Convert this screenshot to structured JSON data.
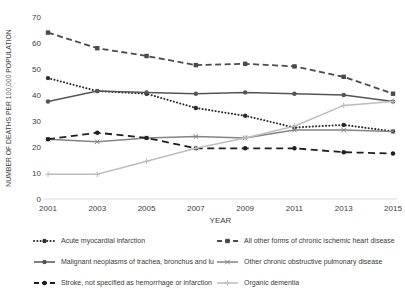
{
  "chart_data": {
    "type": "line",
    "title": "",
    "x": [
      2001,
      2003,
      2005,
      2007,
      2009,
      2011,
      2013,
      2015
    ],
    "xlabel": "YEAR",
    "ylabel": "NUMBER OF DEATHS PER 100,000 POPULATION",
    "y_ticks": [
      0,
      10,
      20,
      30,
      40,
      50,
      60,
      70
    ],
    "ylim": [
      0,
      70
    ],
    "grid": false,
    "legend_position": "bottom",
    "axis_color": "#d9d9d9",
    "text_color": "#3d3d3d",
    "series": [
      {
        "name": "Acute myocardial infarction",
        "values": [
          46.5,
          41.5,
          40.5,
          35,
          32,
          27.5,
          28.5,
          26
        ],
        "color": "#2b2b2b",
        "line": "dotted",
        "marker": "circle"
      },
      {
        "name": "All other forms of chronic ischemic heart disease",
        "values": [
          64,
          58,
          55,
          51.5,
          52,
          51,
          47,
          40.5
        ],
        "color": "#4a4a4a",
        "line": "dashed",
        "marker": "square"
      },
      {
        "name": "Malignant neoplasms of trachea, bronchus and lung",
        "values": [
          37.5,
          41.5,
          41,
          40.5,
          41,
          40.5,
          40,
          37.5
        ],
        "color": "#555555",
        "line": "solid",
        "marker": "circle"
      },
      {
        "name": "Other chronic obstructive pulmonary disease",
        "values": [
          23,
          22,
          23.5,
          24,
          23.5,
          26.5,
          26.5,
          26
        ],
        "color": "#848484",
        "line": "solid",
        "marker": "x"
      },
      {
        "name": "Stroke, not specified as hemorrhage or infarction",
        "values": [
          23,
          25.5,
          23.5,
          19.5,
          19.5,
          19.5,
          18,
          17.5
        ],
        "color": "#1f1f1f",
        "line": "longdash",
        "marker": "circle"
      },
      {
        "name": "Organic dementia",
        "values": [
          9.5,
          9.5,
          14.5,
          19.5,
          23.5,
          28,
          36,
          37.5
        ],
        "color": "#bdbdbd",
        "line": "solid",
        "marker": "plus"
      }
    ]
  }
}
